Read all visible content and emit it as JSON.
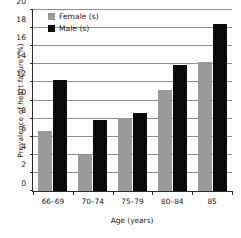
{
  "chart_data": {
    "type": "bar",
    "title": "",
    "xlabel": "Age (years)",
    "ylabel": "Prevalence of heart failure (%)",
    "categories": [
      "66–69",
      "70–74",
      "75–79",
      "80–84",
      "85"
    ],
    "series": [
      {
        "name": "Female (s)",
        "color": "#9a9a9a",
        "values": [
          6.6,
          4.0,
          8.0,
          11.1,
          14.2
        ]
      },
      {
        "name": "Male (s)",
        "color": "#0a0a0a",
        "values": [
          12.2,
          7.8,
          8.6,
          13.9,
          18.3
        ]
      }
    ],
    "ylim": [
      0,
      20
    ],
    "ytick_step": 2,
    "yticks": [
      0,
      2,
      4,
      6,
      8,
      10,
      12,
      14,
      16,
      18,
      20
    ],
    "ytick_labels": [
      "0",
      "2",
      "4",
      "6",
      "8",
      "10",
      "12",
      "14",
      "16",
      "18",
      "20"
    ],
    "grid": "horizontal",
    "legend_position": "top-left"
  },
  "legend": {
    "items": [
      {
        "label": "Female (s)"
      },
      {
        "label": "Male (s)"
      }
    ]
  },
  "axes": {
    "x_title": "Age (years)",
    "y_title": "Prevalence of heart failure (%)"
  }
}
